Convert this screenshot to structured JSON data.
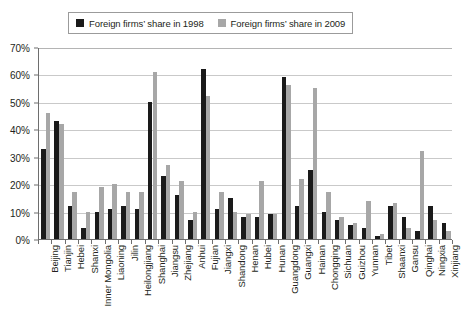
{
  "legend": {
    "items": [
      {
        "label": "Foreign firms’ share in 1998",
        "color": "#1a1a1a",
        "icon": "square-swatch-dark"
      },
      {
        "label": "Foreign firms’ share in 2009",
        "color": "#a7a7a7",
        "icon": "square-swatch-gray"
      }
    ]
  },
  "axis": {
    "y_ticks": [
      "0%",
      "10%",
      "20%",
      "30%",
      "40%",
      "50%",
      "60%",
      "70%"
    ]
  },
  "chart_data": {
    "type": "bar",
    "title": "",
    "xlabel": "",
    "ylabel": "",
    "ylim": [
      0,
      70
    ],
    "ytick_step": 10,
    "ytick_format": "percent",
    "grid": true,
    "legend_position": "top-center",
    "categories": [
      "Beijing",
      "Tianjin",
      "Hebei",
      "Shanxi",
      "Inner Mongolia",
      "Liaoning",
      "Jilin",
      "Heilongjiang",
      "Shanghai",
      "Jiangsu",
      "Zhejiang",
      "Anhui",
      "Fujian",
      "Jiangxi",
      "Shandong",
      "Henan",
      "Hubei",
      "Hunan",
      "Guangdong",
      "Guangxi",
      "Hainan",
      "Chongqing",
      "Sichuan",
      "Guizhou",
      "Yunnan",
      "Tibet",
      "Shaanxi",
      "Gansu",
      "Qinghai",
      "Ningxia",
      "Xinjiang"
    ],
    "series": [
      {
        "name": "Foreign firms’ share in 1998",
        "color": "#1a1a1a",
        "values": [
          33,
          43,
          12,
          4,
          10,
          11,
          12,
          11,
          50,
          23,
          16,
          7,
          62,
          11,
          15,
          8,
          8,
          9,
          59,
          12,
          25,
          10,
          7,
          5,
          4,
          1,
          12,
          8,
          3,
          12,
          6
        ]
      },
      {
        "name": "Foreign firms’ share in 2009",
        "color": "#a7a7a7",
        "values": [
          46,
          42,
          17,
          10,
          19,
          20,
          17,
          17,
          61,
          27,
          21,
          10,
          52,
          17,
          10,
          9,
          21,
          9,
          56,
          22,
          55,
          17,
          8,
          6,
          14,
          2,
          13,
          4,
          32,
          7,
          3
        ]
      }
    ]
  }
}
